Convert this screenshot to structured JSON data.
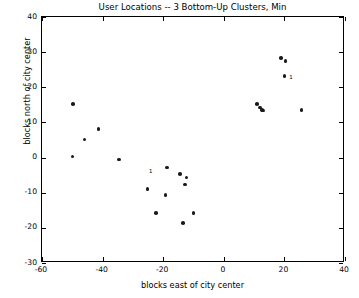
{
  "chart_data": {
    "type": "scatter",
    "title": "User Locations -- 3 Bottom-Up Clusters, Min",
    "xlabel": "blocks east of city center",
    "ylabel": "blocks north of city center",
    "xlim": [
      -60,
      40
    ],
    "ylim": [
      -30,
      40
    ],
    "xticks": [
      -60,
      -40,
      -20,
      0,
      20,
      40
    ],
    "yticks": [
      -30,
      -20,
      -10,
      0,
      10,
      20,
      30,
      40
    ],
    "xticklabels": [
      "-60",
      "-40",
      "-20",
      "0",
      "20",
      "40"
    ],
    "yticklabels": [
      "-30",
      "-20",
      "-10",
      "0",
      "10",
      "20",
      "30",
      "40"
    ],
    "grid": false,
    "legend": null,
    "marker": "dot",
    "marker_color": "#1a1a1a",
    "points": [
      {
        "x": -49.8,
        "y": 15.2
      },
      {
        "x": -49.9,
        "y": 0.3
      },
      {
        "x": -46.0,
        "y": 5.1
      },
      {
        "x": -41.3,
        "y": 8.1
      },
      {
        "x": -34.5,
        "y": -0.5
      },
      {
        "x": -25.2,
        "y": -8.9
      },
      {
        "x": -22.4,
        "y": -15.7
      },
      {
        "x": -19.2,
        "y": -10.7
      },
      {
        "x": -18.7,
        "y": -2.8
      },
      {
        "x": -14.5,
        "y": -4.7
      },
      {
        "x": -13.5,
        "y": -18.7
      },
      {
        "x": -12.9,
        "y": -7.7
      },
      {
        "x": -12.3,
        "y": -5.7
      },
      {
        "x": -10.0,
        "y": -15.7
      },
      {
        "x": 11.0,
        "y": 15.3
      },
      {
        "x": 12.0,
        "y": 14.2
      },
      {
        "x": 12.6,
        "y": 13.6
      },
      {
        "x": 13.0,
        "y": 13.4
      },
      {
        "x": 18.8,
        "y": 28.4
      },
      {
        "x": 20.3,
        "y": 27.4
      },
      {
        "x": 20.0,
        "y": 23.2
      },
      {
        "x": 25.7,
        "y": 13.5
      }
    ],
    "annotations": [
      {
        "label": "1",
        "x": -25.0,
        "y": -3.9
      },
      {
        "label": "1",
        "x": 21.3,
        "y": 22.9
      }
    ]
  }
}
